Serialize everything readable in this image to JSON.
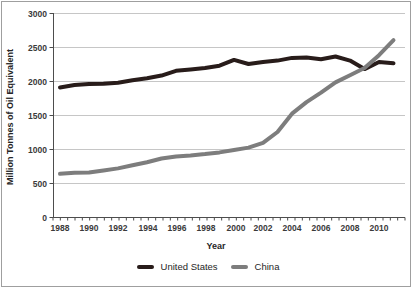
{
  "chart_data": {
    "type": "line",
    "x": [
      1988,
      1989,
      1990,
      1991,
      1992,
      1993,
      1994,
      1995,
      1996,
      1997,
      1998,
      1999,
      2000,
      2001,
      2002,
      2003,
      2004,
      2005,
      2006,
      2007,
      2008,
      2009,
      2010,
      2011
    ],
    "series": [
      {
        "name": "United States",
        "color": "#281c1a",
        "values": [
          1905,
          1940,
          1955,
          1960,
          1975,
          2010,
          2040,
          2080,
          2150,
          2170,
          2190,
          2225,
          2310,
          2250,
          2280,
          2300,
          2340,
          2345,
          2320,
          2360,
          2300,
          2175,
          2280,
          2260
        ]
      },
      {
        "name": "China",
        "color": "#7d7d7d",
        "values": [
          635,
          650,
          655,
          685,
          715,
          760,
          805,
          860,
          890,
          905,
          925,
          950,
          985,
          1020,
          1090,
          1250,
          1520,
          1690,
          1830,
          1980,
          2085,
          2190,
          2380,
          2600
        ]
      }
    ],
    "title": "",
    "xlabel": "Year",
    "ylabel": "Million Tonnes of Oil Equivalent",
    "ylim": [
      0,
      3000
    ],
    "ytick_step": 500,
    "yticks": [
      "3000",
      "2500",
      "2000",
      "1500",
      "1000",
      "500",
      "0"
    ],
    "xtick_labels": [
      "1988",
      "1990",
      "1992",
      "1994",
      "1996",
      "1998",
      "2000",
      "2002",
      "2004",
      "2006",
      "2008",
      "2010"
    ],
    "grid": true,
    "gridline_color": "#c6c6c6",
    "axis_color": "#4d4d4d",
    "legend_position": "bottom"
  }
}
